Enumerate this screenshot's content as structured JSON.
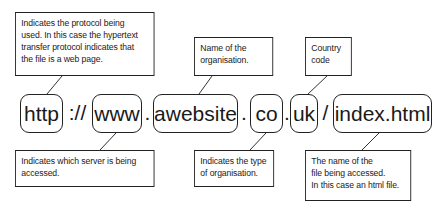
{
  "url_parts": {
    "protocol": "http",
    "sep1": "://",
    "server": "www",
    "dot1": ".",
    "organisation": "awebsite",
    "dot2": ".",
    "org_type": "co",
    "dot3": ".",
    "country": "uk",
    "slash": "/",
    "file": "index.html"
  },
  "callouts": {
    "protocol": [
      "Indicates the protocol being",
      "used. In this case the hypertext",
      "transfer protocol indicates that",
      "the file is a web page."
    ],
    "organisation": [
      "Name of the",
      "organisation."
    ],
    "country": [
      "Country",
      "code"
    ],
    "server": [
      "Indicates which server is being",
      "accessed."
    ],
    "org_type": [
      "Indicates the type",
      "of organisation."
    ],
    "file": [
      "The name of the",
      "file being accessed.",
      "In this case an html file."
    ]
  }
}
